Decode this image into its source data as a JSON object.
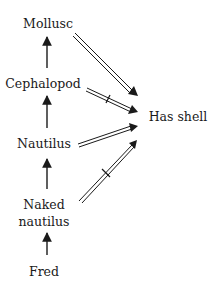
{
  "diagram": {
    "type": "inheritance-network",
    "nodes": [
      {
        "id": "mollusc",
        "label": "Mollusc",
        "x": 48,
        "y": 28
      },
      {
        "id": "cephalopod",
        "label": "Cephalopod",
        "x": 43,
        "y": 88
      },
      {
        "id": "nautilus",
        "label": "Nautilus",
        "x": 44,
        "y": 148
      },
      {
        "id": "naked_nautilus",
        "label_line1": "Naked",
        "label_line2": "nautilus",
        "x": 44,
        "y": 209
      },
      {
        "id": "fred",
        "label": "Fred",
        "x": 44,
        "y": 276
      },
      {
        "id": "has_shell",
        "label": "Has shell",
        "x": 178,
        "y": 121
      }
    ],
    "isa_edges": [
      {
        "from": "cephalopod",
        "to": "mollusc",
        "style": "single-arrow"
      },
      {
        "from": "nautilus",
        "to": "cephalopod",
        "style": "single-arrow"
      },
      {
        "from": "naked_nautilus",
        "to": "nautilus",
        "style": "single-arrow"
      },
      {
        "from": "fred",
        "to": "naked_nautilus",
        "style": "single-arrow"
      }
    ],
    "property_edges": [
      {
        "from": "mollusc",
        "to": "has_shell",
        "style": "double-arrow",
        "negated": false
      },
      {
        "from": "cephalopod",
        "to": "has_shell",
        "style": "double-arrow",
        "negated": true
      },
      {
        "from": "nautilus",
        "to": "has_shell",
        "style": "double-arrow",
        "negated": false
      },
      {
        "from": "naked_nautilus",
        "to": "has_shell",
        "style": "double-arrow",
        "negated": true
      }
    ],
    "colors": {
      "ink": "#1a1a1a",
      "background": "#ffffff"
    }
  }
}
